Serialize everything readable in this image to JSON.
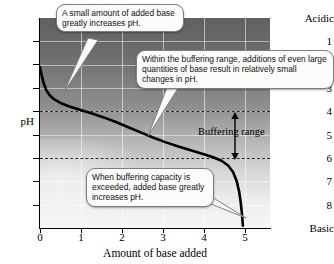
{
  "chart_data": {
    "type": "line",
    "title": "",
    "xlabel": "Amount of base added",
    "ylabel": "pH",
    "xlim": [
      0,
      5.6
    ],
    "ylim": [
      0,
      9
    ],
    "y_inverted": true,
    "grid": true,
    "legend": null,
    "x_ticks": [
      "0",
      "1",
      "2",
      "3",
      "4",
      "5"
    ],
    "x_tick_values": [
      0,
      1,
      2,
      3,
      4,
      5
    ],
    "y_ticks": [
      "1",
      "2",
      "3",
      "4",
      "5",
      "6",
      "7",
      "8"
    ],
    "y_tick_values": [
      1,
      2,
      3,
      4,
      5,
      6,
      7,
      8
    ],
    "y_axis_top_label": "Acidic",
    "y_axis_bottom_label": "Basic",
    "series": [
      {
        "name": "Titration curve",
        "color": "#000000",
        "points": [
          [
            0.0,
            2.1
          ],
          [
            0.04,
            2.45
          ],
          [
            0.09,
            2.8
          ],
          [
            0.15,
            3.08
          ],
          [
            0.23,
            3.3
          ],
          [
            0.34,
            3.48
          ],
          [
            0.5,
            3.64
          ],
          [
            0.7,
            3.78
          ],
          [
            0.95,
            3.92
          ],
          [
            1.25,
            4.08
          ],
          [
            1.55,
            4.26
          ],
          [
            1.85,
            4.46
          ],
          [
            2.15,
            4.68
          ],
          [
            2.45,
            4.9
          ],
          [
            2.75,
            5.12
          ],
          [
            3.05,
            5.32
          ],
          [
            3.35,
            5.5
          ],
          [
            3.65,
            5.66
          ],
          [
            3.95,
            5.82
          ],
          [
            4.2,
            5.96
          ],
          [
            4.42,
            6.12
          ],
          [
            4.58,
            6.32
          ],
          [
            4.7,
            6.6
          ],
          [
            4.79,
            7.0
          ],
          [
            4.85,
            7.45
          ],
          [
            4.89,
            7.95
          ],
          [
            4.92,
            8.45
          ],
          [
            4.94,
            8.9
          ]
        ]
      }
    ],
    "reference_lines": [
      {
        "name": "buffering-range-upper",
        "axis": "y",
        "value": 4,
        "style": "dashed"
      },
      {
        "name": "buffering-range-lower",
        "axis": "y",
        "value": 6,
        "style": "dashed"
      }
    ],
    "annotations": [
      {
        "name": "callout-steep-initial-rise",
        "text": "A small amount of added base greatly increases pH.",
        "points_to": [
          0.25,
          3.3
        ]
      },
      {
        "name": "callout-buffering-plateau",
        "text": "Within  the buffering range, additions of even large quantities of base result in relatively small changes in pH.",
        "points_to": [
          2.4,
          4.6
        ]
      },
      {
        "name": "callout-capacity-exceeded",
        "text": "When buffering capacity is exceeded, added base greatly increases pH.",
        "points_to": [
          4.9,
          7.6
        ]
      },
      {
        "name": "buffering-range-bracket",
        "text": "Buffering range",
        "span_y": [
          4,
          6
        ]
      }
    ]
  }
}
